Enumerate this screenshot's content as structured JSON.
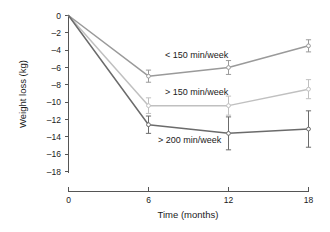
{
  "chart_data": {
    "type": "line",
    "title": "",
    "xlabel": "Time (months)",
    "ylabel": "Weight loss (kg)",
    "x": [
      0,
      6,
      12,
      18
    ],
    "xticks": [
      0,
      6,
      12,
      18
    ],
    "xtick_labels": [
      "0",
      "6",
      "12",
      "18"
    ],
    "xlim": [
      0,
      18
    ],
    "yticks": [
      0,
      -2,
      -4,
      -6,
      -8,
      -10,
      -12,
      -14,
      -16,
      -18
    ],
    "ytick_labels": [
      "0",
      "–2",
      "–4",
      "–6",
      "–8",
      "–10",
      "–12",
      "–14",
      "–16",
      "–18"
    ],
    "ylim": [
      -18,
      0
    ],
    "grid": false,
    "legend_position": "inline-annotations",
    "series": [
      {
        "name": "< 150 min/week",
        "color": "#9a9a9a",
        "values": [
          0,
          -7.0,
          -6.0,
          -3.5
        ],
        "errors": [
          0,
          0.7,
          0.8,
          0.7
        ]
      },
      {
        "name": "> 150 min/week",
        "color": "#c0c0c0",
        "values": [
          0,
          -10.4,
          -10.4,
          -8.5
        ],
        "errors": [
          0,
          0.9,
          1.1,
          1.1
        ]
      },
      {
        "name": "> 200 min/week",
        "color": "#6b6b6b",
        "values": [
          0,
          -12.6,
          -13.6,
          -13.1
        ],
        "errors": [
          0,
          1.0,
          1.9,
          2.1
        ]
      }
    ],
    "annotations": [
      {
        "text": "< 150 min/week",
        "x": 7.2,
        "y": -4.7,
        "series": "< 150 min/week"
      },
      {
        "text": "> 150 min/week",
        "x": 7.2,
        "y": -9.0,
        "series": "> 150 min/week"
      },
      {
        "text": "> 200 min/week",
        "x": 6.7,
        "y": -14.6,
        "series": "> 200 min/week"
      }
    ]
  },
  "axis": {
    "x_title": "Time (months)",
    "y_title": "Weight loss (kg)"
  }
}
